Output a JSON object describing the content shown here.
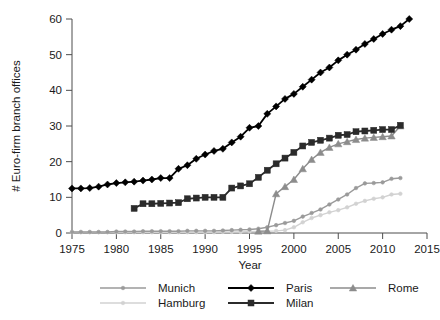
{
  "chart_data": {
    "type": "line",
    "title": "",
    "xlabel": "Year",
    "ylabel": "# Euro-firm branch offices",
    "xlim": [
      1975,
      2015
    ],
    "ylim": [
      0,
      60
    ],
    "xticks": [
      1975,
      1980,
      1985,
      1990,
      1995,
      2000,
      2005,
      2010,
      2015
    ],
    "yticks": [
      0,
      10,
      20,
      30,
      40,
      50,
      60
    ],
    "grid": false,
    "legend_position": "bottom",
    "series": [
      {
        "name": "Munich",
        "color": "#9a9a9a",
        "marker": "circle",
        "x": [
          1975,
          1976,
          1977,
          1978,
          1979,
          1980,
          1981,
          1982,
          1983,
          1984,
          1985,
          1986,
          1987,
          1988,
          1989,
          1990,
          1991,
          1992,
          1993,
          1994,
          1995,
          1996,
          1997,
          1998,
          1999,
          2000,
          2001,
          2002,
          2003,
          2004,
          2005,
          2006,
          2007,
          2008,
          2009,
          2010,
          2011,
          2012
        ],
        "y": [
          0.3,
          0.3,
          0.3,
          0.3,
          0.3,
          0.4,
          0.4,
          0.4,
          0.5,
          0.5,
          0.5,
          0.5,
          0.5,
          0.6,
          0.6,
          0.6,
          0.6,
          0.7,
          0.8,
          0.9,
          1.0,
          1.2,
          1.6,
          2.2,
          2.8,
          3.4,
          4.6,
          5.6,
          6.6,
          8.0,
          9.4,
          10.8,
          12.6,
          13.9,
          14.0,
          14.2,
          15.2,
          15.4
        ]
      },
      {
        "name": "Hamburg",
        "color": "#d2d2d2",
        "marker": "circle",
        "x": [
          1975,
          1976,
          1977,
          1978,
          1979,
          1980,
          1981,
          1982,
          1983,
          1984,
          1985,
          1986,
          1987,
          1988,
          1989,
          1990,
          1991,
          1992,
          1993,
          1994,
          1995,
          1996,
          1997,
          1998,
          1999,
          2000,
          2001,
          2002,
          2003,
          2004,
          2005,
          2006,
          2007,
          2008,
          2009,
          2010,
          2011,
          2012
        ],
        "y": [
          0.2,
          0.2,
          0.2,
          0.2,
          0.2,
          0.2,
          0.2,
          0.2,
          0.2,
          0.2,
          0.2,
          0.2,
          0.2,
          0.2,
          0.2,
          0.2,
          0.2,
          0.3,
          0.3,
          0.3,
          0.4,
          0.4,
          0.5,
          0.6,
          0.8,
          1.6,
          3.0,
          4.2,
          5.0,
          5.8,
          6.4,
          7.2,
          8.2,
          9.0,
          9.6,
          10.0,
          10.8,
          11.0
        ]
      },
      {
        "name": "Paris",
        "color": "#000000",
        "marker": "diamond",
        "x": [
          1975,
          1976,
          1977,
          1978,
          1979,
          1980,
          1981,
          1982,
          1983,
          1984,
          1985,
          1986,
          1987,
          1988,
          1989,
          1990,
          1991,
          1992,
          1993,
          1994,
          1995,
          1996,
          1997,
          1998,
          1999,
          2000,
          2001,
          2002,
          2003,
          2004,
          2005,
          2006,
          2007,
          2008,
          2009,
          2010,
          2011,
          2012,
          2013
        ],
        "y": [
          12.5,
          12.5,
          12.6,
          13.0,
          13.6,
          14.0,
          14.2,
          14.4,
          14.7,
          15.0,
          15.4,
          15.4,
          18.0,
          19.0,
          20.8,
          22.0,
          23.0,
          23.6,
          25.4,
          27.0,
          29.5,
          30.0,
          33.4,
          35.5,
          37.6,
          39.0,
          41.0,
          43.0,
          45.0,
          46.4,
          48.4,
          50.0,
          51.4,
          53.0,
          54.4,
          55.8,
          57.0,
          58.0,
          60.0
        ]
      },
      {
        "name": "Milan",
        "color": "#2b2b2b",
        "marker": "square",
        "x": [
          1982,
          1983,
          1984,
          1985,
          1986,
          1987,
          1988,
          1989,
          1990,
          1991,
          1992,
          1993,
          1994,
          1995,
          1996,
          1997,
          1998,
          1999,
          2000,
          2001,
          2002,
          2003,
          2004,
          2005,
          2006,
          2007,
          2008,
          2009,
          2010,
          2011,
          2012
        ],
        "y": [
          6.9,
          8.2,
          8.2,
          8.3,
          8.4,
          8.5,
          9.6,
          9.8,
          10.0,
          10.0,
          10.0,
          12.6,
          13.2,
          13.8,
          15.6,
          17.6,
          19.4,
          21.0,
          22.6,
          24.4,
          25.4,
          26.0,
          26.6,
          27.4,
          27.6,
          28.4,
          28.6,
          28.8,
          29.0,
          29.0,
          30.2
        ]
      },
      {
        "name": "Rome",
        "color": "#8c8c8c",
        "marker": "triangle",
        "x": [
          1996,
          1997,
          1998,
          1999,
          2000,
          2001,
          2002,
          2003,
          2004,
          2005,
          2006,
          2007,
          2008,
          2009,
          2010,
          2011,
          2012
        ],
        "y": [
          0.5,
          0.6,
          11.0,
          13.0,
          15.0,
          18.0,
          20.6,
          22.6,
          24.0,
          25.0,
          25.6,
          26.2,
          26.6,
          26.8,
          27.0,
          27.2,
          30.0
        ]
      }
    ]
  },
  "legend": {
    "entries": [
      {
        "label": "Munich"
      },
      {
        "label": "Hamburg"
      },
      {
        "label": "Paris"
      },
      {
        "label": "Milan"
      },
      {
        "label": "Rome"
      }
    ]
  }
}
